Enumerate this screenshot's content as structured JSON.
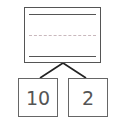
{
  "diagram": {
    "type": "number-bond",
    "whole": {
      "value": "",
      "writing_lines": [
        "solid",
        "dashed",
        "solid"
      ]
    },
    "parts": [
      {
        "value": "10"
      },
      {
        "value": "2"
      }
    ],
    "colors": {
      "stroke": "#555555",
      "dashed_line": "#c9b8bd",
      "text": "#555555"
    }
  }
}
